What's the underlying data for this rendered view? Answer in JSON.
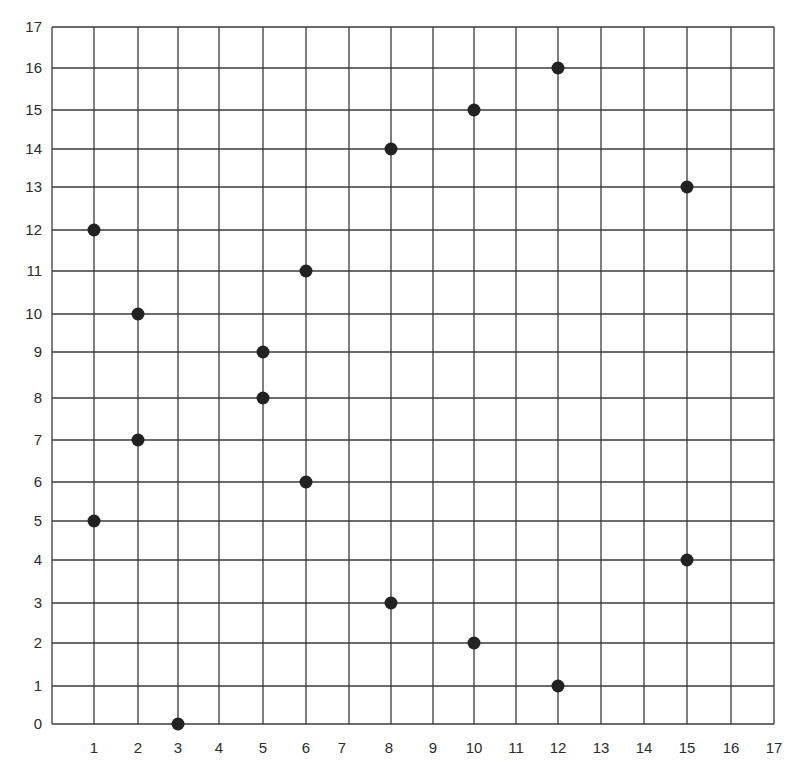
{
  "chart_data": {
    "type": "scatter",
    "title": "",
    "xlabel": "",
    "ylabel": "",
    "xlim": [
      0,
      17
    ],
    "ylim": [
      0,
      17
    ],
    "grid": true,
    "legend": null,
    "x_ticks": [
      1,
      2,
      3,
      4,
      5,
      6,
      7,
      8,
      9,
      10,
      11,
      12,
      13,
      14,
      15,
      16,
      17
    ],
    "y_ticks": [
      0,
      1,
      2,
      3,
      4,
      5,
      6,
      7,
      8,
      9,
      10,
      11,
      12,
      13,
      14,
      15,
      16,
      17
    ],
    "series": [
      {
        "name": "points",
        "color": "#222222",
        "points": [
          {
            "x": 1,
            "y": 12
          },
          {
            "x": 1,
            "y": 5
          },
          {
            "x": 2,
            "y": 10
          },
          {
            "x": 2,
            "y": 7
          },
          {
            "x": 3,
            "y": 0
          },
          {
            "x": 5,
            "y": 9
          },
          {
            "x": 5,
            "y": 8
          },
          {
            "x": 6,
            "y": 11
          },
          {
            "x": 6,
            "y": 6
          },
          {
            "x": 8,
            "y": 14
          },
          {
            "x": 8,
            "y": 3
          },
          {
            "x": 10,
            "y": 15
          },
          {
            "x": 10,
            "y": 2
          },
          {
            "x": 12,
            "y": 16
          },
          {
            "x": 12,
            "y": 1
          },
          {
            "x": 15,
            "y": 13
          },
          {
            "x": 15,
            "y": 4
          }
        ]
      }
    ]
  },
  "layout": {
    "x_pixels": [
      52,
      94,
      138,
      178,
      219,
      263,
      306,
      349,
      391,
      433,
      474,
      516,
      558,
      601,
      644,
      687,
      731,
      774
    ],
    "y_pixels": [
      724,
      686,
      643,
      603,
      560,
      521,
      482,
      440,
      398,
      352,
      314,
      271,
      230,
      187,
      149,
      110,
      68,
      27
    ],
    "x_label_offsets": {
      "7": -7,
      "8": -2
    },
    "colors": {
      "grid": "#3a3a3a",
      "text": "#2b2b2b",
      "point": "#222222",
      "background": "#ffffff"
    }
  }
}
